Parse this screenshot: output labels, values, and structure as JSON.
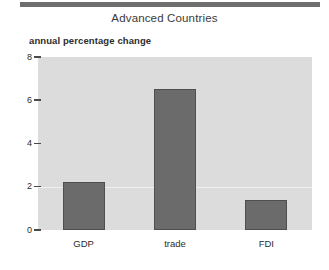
{
  "decor": {
    "top_rule_color": "#6e6e6e"
  },
  "chart_data": {
    "type": "bar",
    "title": "Advanced Countries",
    "subtitle": "annual percentage change",
    "xlabel": "",
    "ylabel": "",
    "categories": [
      "GDP",
      "trade",
      "FDI"
    ],
    "values": [
      2.2,
      6.5,
      1.4
    ],
    "series": [
      {
        "name": "annual percentage change",
        "values": [
          2.2,
          6.5,
          1.4
        ],
        "color": "#6b6b6b"
      }
    ],
    "ylim": [
      0,
      8
    ],
    "yticks": [
      0,
      2,
      4,
      6,
      8
    ],
    "ytick_labels": [
      "0",
      "2",
      "4",
      "6",
      "8"
    ],
    "grid": "horizontal-faint",
    "gridline_values": [
      2
    ],
    "legend": "none",
    "plot_background": "#dcdcdc",
    "bar_color": "#6b6b6b",
    "bar_edge_color": "#4f4f4f"
  }
}
